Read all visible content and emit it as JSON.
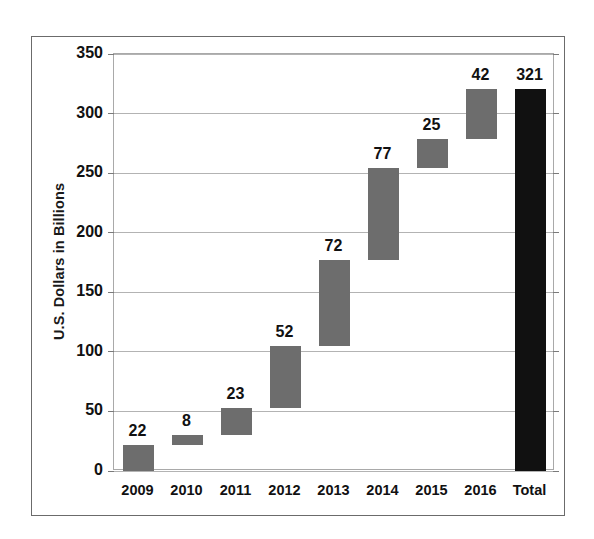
{
  "chart_data": {
    "type": "bar",
    "subtype": "waterfall",
    "title": "",
    "xlabel": "",
    "ylabel": "U.S. Dollars in Billions",
    "categories": [
      "2009",
      "2010",
      "2011",
      "2012",
      "2013",
      "2014",
      "2015",
      "2016",
      "Total"
    ],
    "values": [
      22,
      8,
      23,
      52,
      72,
      77,
      25,
      42,
      321
    ],
    "data_labels": [
      "22",
      "8",
      "23",
      "52",
      "72",
      "77",
      "25",
      "42",
      "321"
    ],
    "bar_kinds": [
      "step",
      "step",
      "step",
      "step",
      "step",
      "step",
      "step",
      "step",
      "total"
    ],
    "cumulative_start": [
      0,
      22,
      30,
      53,
      105,
      177,
      254,
      279,
      0
    ],
    "cumulative_end": [
      22,
      30,
      53,
      105,
      177,
      254,
      279,
      321,
      321
    ],
    "ylim": [
      0,
      350
    ],
    "ytick_labels": [
      "0",
      "50",
      "100",
      "150",
      "200",
      "250",
      "300",
      "350"
    ],
    "ytick_values": [
      0,
      50,
      100,
      150,
      200,
      250,
      300,
      350
    ],
    "grid": true,
    "legend": null,
    "colors": {
      "step_bar": "#6d6d6d",
      "total_bar": "#111111",
      "gridline": "#b3b3b3",
      "plot_border": "#a9a9a9",
      "figure_border": "#6b6b6b",
      "text": "#111111",
      "background": "#ffffff"
    }
  }
}
